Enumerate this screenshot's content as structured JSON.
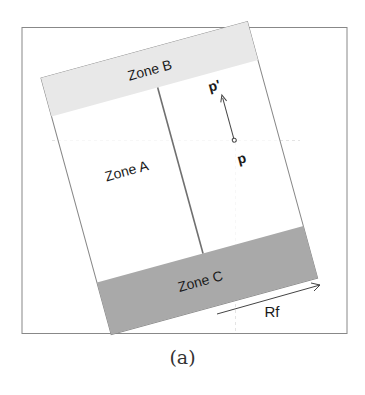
{
  "figure": {
    "caption": "(a)",
    "zones": {
      "zone_a": "Zone A",
      "zone_b": "Zone B",
      "zone_c": "Zone C"
    },
    "points": {
      "p": "p",
      "p_prime": "p'"
    },
    "arrow_label": "Rf",
    "colors": {
      "zone_b_fill": "#e6e6e6",
      "zone_c_fill": "#a9a9a9",
      "frame": "#777777",
      "divider": "#777777"
    }
  }
}
